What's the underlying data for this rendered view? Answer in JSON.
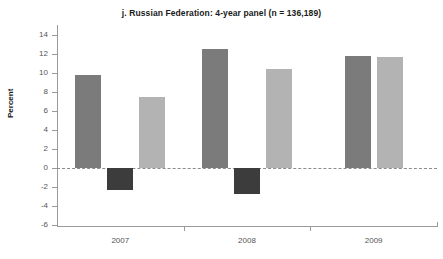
{
  "chart_data": {
    "type": "bar",
    "title": "j. Russian Federation: 4-year panel (n = 136,189)",
    "xlabel": "",
    "ylabel": "Percent",
    "categories": [
      "2007",
      "2008",
      "2009"
    ],
    "ylim": [
      -6,
      14
    ],
    "yticks": [
      14,
      12,
      10,
      8,
      6,
      4,
      2,
      0,
      -2,
      -4,
      -6
    ],
    "ytick_labels": [
      "14",
      "12",
      "10",
      "8",
      "6",
      "4",
      "2",
      "0",
      "-2",
      "-4",
      "-6"
    ],
    "grid": false,
    "legend": "none",
    "zero_line": true,
    "series": [
      {
        "name": "series-1",
        "color": "#7b7b7b",
        "values": [
          9.8,
          12.5,
          11.8
        ]
      },
      {
        "name": "series-2",
        "color": "#3c3c3c",
        "values": [
          -2.3,
          -2.7,
          null
        ]
      },
      {
        "name": "series-3",
        "color": "#b3b3b3",
        "values": [
          7.5,
          10.4,
          11.7
        ]
      }
    ],
    "colors": {
      "series_1": "#7b7b7b",
      "series_2": "#3c3c3c",
      "series_3": "#b3b3b3",
      "axis": "#9a9a9a",
      "text": "#1a1a1a",
      "tick_text": "#555555"
    }
  }
}
